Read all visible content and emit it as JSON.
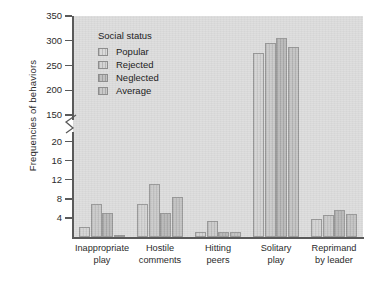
{
  "chart_data": {
    "type": "bar",
    "title": "",
    "xlabel": "",
    "ylabel": "Frequencies of behaviors",
    "categories": [
      "Inappropriate play",
      "Hostile comments",
      "Hitting peers",
      "Solitary play",
      "Reprimand by leader"
    ],
    "category_lines": [
      [
        "Inappropriate",
        "play"
      ],
      [
        "Hostile",
        "comments"
      ],
      [
        "Hitting",
        "peers"
      ],
      [
        "Solitary",
        "play"
      ],
      [
        "Reprimand",
        "by leader"
      ]
    ],
    "legend_title": "Social status",
    "legend_position": "top-left inside plot",
    "grid": false,
    "axis_break": true,
    "y_ticks_lower": [
      "4",
      "8",
      "12",
      "16",
      "20"
    ],
    "y_ticks_upper": [
      "150",
      "200",
      "250",
      "300",
      "350"
    ],
    "ylim_lower": [
      0,
      22
    ],
    "ylim_upper": [
      140,
      350
    ],
    "series": [
      {
        "name": "Popular",
        "color": "#d2d2d2",
        "values": [
          2.0,
          7.0,
          1.0,
          275,
          3.7
        ]
      },
      {
        "name": "Rejected",
        "color": "#c8c8c8",
        "values": [
          7.0,
          11.1,
          3.3,
          295,
          4.7
        ]
      },
      {
        "name": "Neglected",
        "color": "#b4b4b4",
        "values": [
          5.1,
          5.1,
          1.0,
          305,
          5.7
        ]
      },
      {
        "name": "Average",
        "color": "#c0c0c0",
        "values": [
          0.5,
          8.4,
          1.0,
          288,
          4.9
        ]
      }
    ]
  },
  "figure": {
    "background_color": "#ffffff",
    "plot_background_color": "#dedede",
    "axis_color": "#5a5a5a"
  }
}
